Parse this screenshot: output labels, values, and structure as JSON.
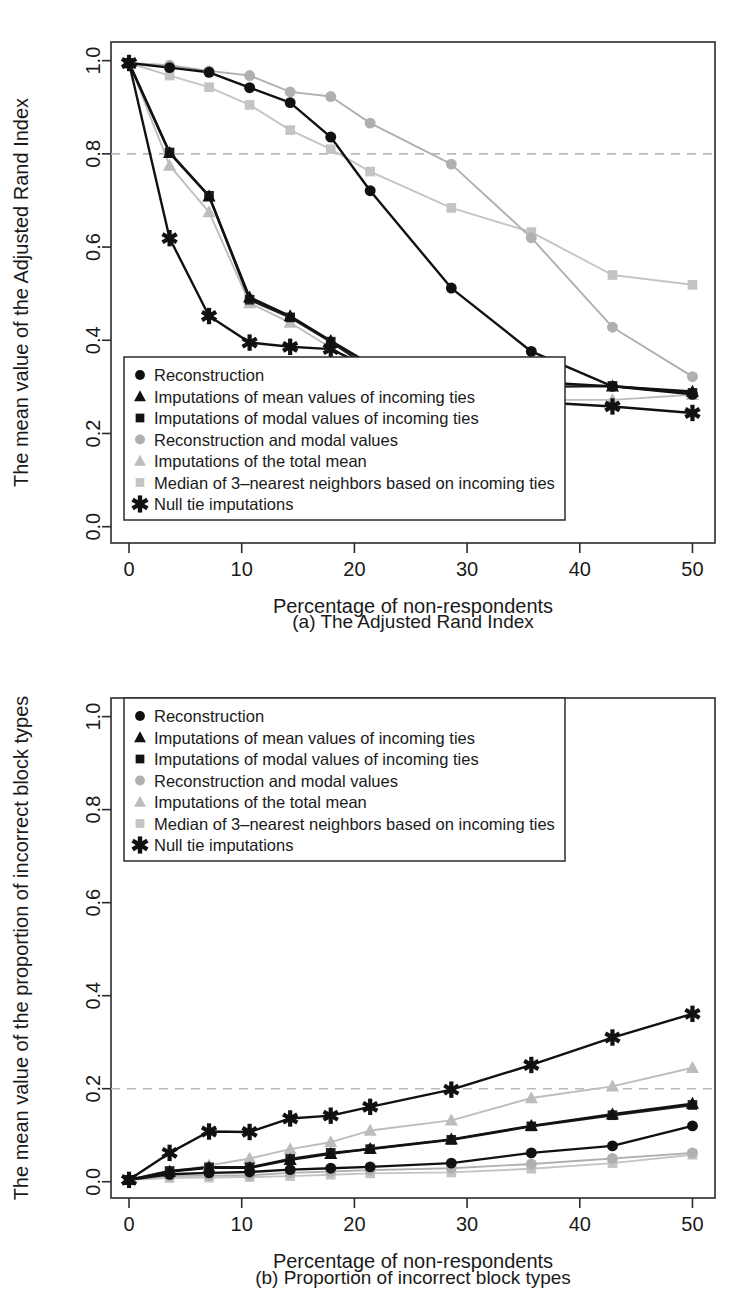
{
  "figure": {
    "panels": [
      {
        "id": "a",
        "caption": "(a) The Adjusted Rand Index",
        "xlabel": "Percentage of non-respondents",
        "ylabel": "The mean value of the Adjusted Rand Index"
      },
      {
        "id": "b",
        "caption": "(b) Proportion of incorrect block types",
        "xlabel": "Percentage of non-respondents",
        "ylabel": "The mean value of the proportion of incorrect block types"
      }
    ]
  },
  "colors": {
    "black": "#111111",
    "dark": "#1f1f1f",
    "gray_mid": "#b0b0b0",
    "gray_light": "#c4c4c4",
    "gray_lighter": "#bdbdbd",
    "reference_line": "#b9b9b9",
    "axis": "#2b2b2b",
    "background": "#ffffff"
  },
  "legend_entries": [
    {
      "label": "Reconstruction",
      "marker": "circle",
      "color": "#111111"
    },
    {
      "label": "Imputations of mean values of incoming ties",
      "marker": "triangle",
      "color": "#111111"
    },
    {
      "label": "Imputations of modal values of incoming ties",
      "marker": "square",
      "color": "#111111"
    },
    {
      "label": "Reconstruction and modal values",
      "marker": "circle",
      "color": "#b0b0b0"
    },
    {
      "label": "Imputations of the total mean",
      "marker": "triangle",
      "color": "#bdbdbd"
    },
    {
      "label": "Median of 3–nearest neighbors based on incoming ties",
      "marker": "square",
      "color": "#c4c4c4"
    },
    {
      "label": "Null tie imputations",
      "marker": "asterisk",
      "color": "#111111"
    }
  ],
  "chart_data": [
    {
      "type": "line",
      "panel": "a",
      "title": "(a) The Adjusted Rand Index",
      "xlabel": "Percentage of non-respondents",
      "ylabel": "The mean value of the Adjusted Rand Index",
      "xlim": [
        -1.6,
        52
      ],
      "ylim": [
        -0.035,
        1.04
      ],
      "xticks": [
        0,
        10,
        20,
        30,
        40,
        50
      ],
      "xticklabels": [
        "0",
        "10",
        "20",
        "30",
        "40",
        "50"
      ],
      "yticks": [
        0.0,
        0.2,
        0.4,
        0.6,
        0.8,
        1.0
      ],
      "yticklabels": [
        "0.0",
        "0.2",
        "0.4",
        "0.6",
        "0.8",
        "1.0"
      ],
      "grid": false,
      "reference_line": {
        "axis": "y",
        "value": 0.8,
        "style": "dashed",
        "color": "#b9b9b9"
      },
      "legend_position": "bottom-left",
      "x": [
        0,
        3.6,
        7.1,
        10.7,
        14.3,
        17.9,
        21.4,
        28.6,
        35.7,
        42.9,
        50
      ],
      "series": [
        {
          "name": "Reconstruction",
          "marker": "circle",
          "color": "#111111",
          "values": [
            0.995,
            0.985,
            0.975,
            0.942,
            0.91,
            0.836,
            0.721,
            0.512,
            0.376,
            0.301,
            0.284
          ]
        },
        {
          "name": "Imputations of mean values of incoming ties",
          "marker": "triangle",
          "color": "#111111",
          "values": [
            0.995,
            0.802,
            0.709,
            0.492,
            0.452,
            0.399,
            0.349,
            0.325,
            0.311,
            0.301,
            0.29
          ]
        },
        {
          "name": "Imputations of modal values of incoming ties",
          "marker": "square",
          "color": "#1f1f1f",
          "values": [
            0.995,
            0.803,
            0.71,
            0.487,
            0.449,
            0.397,
            0.34,
            0.314,
            0.3,
            0.302,
            0.287
          ]
        },
        {
          "name": "Reconstruction and modal values",
          "marker": "circle",
          "color": "#b0b0b0",
          "values": [
            0.995,
            0.99,
            0.978,
            0.968,
            0.933,
            0.923,
            0.866,
            0.778,
            0.62,
            0.428,
            0.322
          ]
        },
        {
          "name": "Imputations of the total mean",
          "marker": "triangle",
          "color": "#bdbdbd",
          "values": [
            0.995,
            0.775,
            0.675,
            0.48,
            0.438,
            0.384,
            0.335,
            0.31,
            0.272,
            0.272,
            0.283
          ]
        },
        {
          "name": "Median of 3–nearest neighbors based on incoming ties",
          "marker": "square",
          "color": "#c4c4c4",
          "values": [
            0.995,
            0.968,
            0.943,
            0.905,
            0.851,
            0.81,
            0.762,
            0.684,
            0.632,
            0.54,
            0.519
          ]
        },
        {
          "name": "Null tie imputations",
          "marker": "asterisk",
          "color": "#111111",
          "values": [
            0.995,
            0.619,
            0.452,
            0.395,
            0.386,
            0.381,
            0.341,
            0.323,
            0.268,
            0.258,
            0.244
          ]
        }
      ]
    },
    {
      "type": "line",
      "panel": "b",
      "title": "(b) Proportion of incorrect block types",
      "xlabel": "Percentage of non-respondents",
      "ylabel": "The mean value of the proportion of incorrect block types",
      "xlim": [
        -1.6,
        52
      ],
      "ylim": [
        -0.035,
        1.04
      ],
      "xticks": [
        0,
        10,
        20,
        30,
        40,
        50
      ],
      "xticklabels": [
        "0",
        "10",
        "20",
        "30",
        "40",
        "50"
      ],
      "yticks": [
        0.0,
        0.2,
        0.4,
        0.6,
        0.8,
        1.0
      ],
      "yticklabels": [
        "0.0",
        "0.2",
        "0.4",
        "0.6",
        "0.8",
        "1.0"
      ],
      "grid": false,
      "reference_line": {
        "axis": "y",
        "value": 0.2,
        "style": "dashed",
        "color": "#b9b9b9"
      },
      "legend_position": "top-left",
      "x": [
        0,
        3.6,
        7.1,
        10.7,
        14.3,
        17.9,
        21.4,
        28.6,
        35.7,
        42.9,
        50
      ],
      "series": [
        {
          "name": "Reconstruction",
          "marker": "circle",
          "color": "#111111",
          "values": [
            0.004,
            0.016,
            0.019,
            0.021,
            0.026,
            0.029,
            0.032,
            0.04,
            0.062,
            0.077,
            0.12
          ]
        },
        {
          "name": "Imputations of mean values of incoming ties",
          "marker": "triangle",
          "color": "#111111",
          "values": [
            0.004,
            0.022,
            0.03,
            0.03,
            0.047,
            0.06,
            0.071,
            0.091,
            0.12,
            0.145,
            0.168
          ]
        },
        {
          "name": "Imputations of modal values of incoming ties",
          "marker": "square",
          "color": "#1f1f1f",
          "values": [
            0.004,
            0.023,
            0.031,
            0.031,
            0.049,
            0.062,
            0.07,
            0.09,
            0.119,
            0.143,
            0.165
          ]
        },
        {
          "name": "Reconstruction and modal values",
          "marker": "circle",
          "color": "#b0b0b0",
          "values": [
            0.004,
            0.012,
            0.013,
            0.014,
            0.019,
            0.022,
            0.025,
            0.029,
            0.038,
            0.05,
            0.062
          ]
        },
        {
          "name": "Imputations of the total mean",
          "marker": "triangle",
          "color": "#bdbdbd",
          "values": [
            0.004,
            0.02,
            0.035,
            0.05,
            0.07,
            0.085,
            0.11,
            0.132,
            0.18,
            0.205,
            0.245
          ]
        },
        {
          "name": "Median of 3–nearest neighbors based on incoming ties",
          "marker": "square",
          "color": "#c4c4c4",
          "values": [
            0.004,
            0.008,
            0.009,
            0.01,
            0.012,
            0.015,
            0.018,
            0.02,
            0.028,
            0.04,
            0.058
          ]
        },
        {
          "name": "Null tie imputations",
          "marker": "asterisk",
          "color": "#111111",
          "values": [
            0.004,
            0.062,
            0.108,
            0.107,
            0.136,
            0.142,
            0.161,
            0.198,
            0.251,
            0.31,
            0.361
          ]
        }
      ]
    }
  ]
}
